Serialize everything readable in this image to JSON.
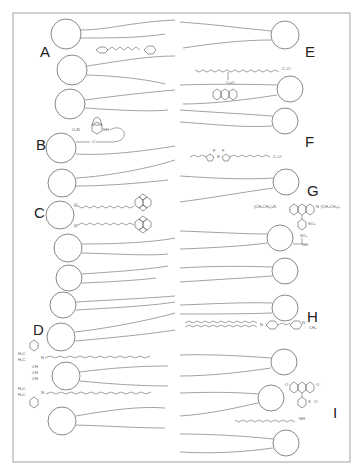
{
  "figure": {
    "frame": {
      "x": 13,
      "y": 13,
      "w": 337,
      "h": 449
    },
    "colors": {
      "line": "#7a7a7a",
      "label": "#222222",
      "background": "#ffffff"
    },
    "labels": [
      {
        "id": "A",
        "text": "A",
        "x": 40,
        "y": 57
      },
      {
        "id": "B",
        "text": "B",
        "x": 36,
        "y": 150
      },
      {
        "id": "C",
        "text": "C",
        "x": 34,
        "y": 218
      },
      {
        "id": "D",
        "text": "D",
        "x": 33,
        "y": 335
      },
      {
        "id": "E",
        "text": "E",
        "x": 305,
        "y": 57
      },
      {
        "id": "F",
        "text": "F",
        "x": 305,
        "y": 147
      },
      {
        "id": "G",
        "text": "G",
        "x": 307,
        "y": 196
      },
      {
        "id": "H",
        "text": "H",
        "x": 307,
        "y": 322
      },
      {
        "id": "I",
        "text": "I",
        "x": 333,
        "y": 418
      }
    ],
    "probes": [
      {
        "id": "A",
        "name": "diphenylhexatriene",
        "chem_labels": []
      },
      {
        "id": "B",
        "name": "NBD-labeled lipid",
        "chem_labels": [
          "O₂N",
          "N",
          "O",
          "N",
          "NH",
          "O"
        ]
      },
      {
        "id": "C",
        "name": "pyrene-labeled phospholipid",
        "chem_labels": [
          "O",
          "O"
        ]
      },
      {
        "id": "D",
        "name": "indocarbocyanine dye (DiI)",
        "chem_labels": [
          "H₃C",
          "H₃C",
          "N",
          "CH",
          "CH",
          "CH",
          "H₃C",
          "H₃C",
          "N⁺"
        ]
      },
      {
        "id": "E",
        "name": "anthroyloxy fatty acid",
        "chem_labels": [
          "O",
          "C–O⁻",
          "O",
          "C=O"
        ]
      },
      {
        "id": "F",
        "name": "BODIPY fatty acid",
        "chem_labels": [
          "F",
          "F",
          "B",
          "N",
          "N",
          "O",
          "C–O⁻"
        ]
      },
      {
        "id": "G",
        "name": "rhodamine-labeled lipid",
        "chem_labels": [
          "(CH₃CH₂)₂N",
          "O",
          "N⁺(CH₂CH₃)₂",
          "SO₃⁻",
          "SO₂",
          "NH"
        ]
      },
      {
        "id": "H",
        "name": "aminostyryl pyridinium dye",
        "chem_labels": [
          "N",
          "N⁺",
          "CH₃"
        ]
      },
      {
        "id": "I",
        "name": "fluorescein-labeled lipid",
        "chem_labels": [
          "O",
          "O",
          "O⁻",
          "S",
          "O",
          "O⁻",
          "O",
          "NH",
          "O"
        ]
      }
    ]
  }
}
